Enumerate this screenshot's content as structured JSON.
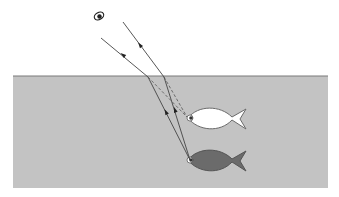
{
  "diagram": {
    "colors": {
      "background": "#ffffff",
      "water": "#c3c3c3",
      "water_surface": "#7a7a7a",
      "ray": "#444444",
      "virtual_ray": "#555555",
      "real_fish": "#6b6b6b",
      "apparent_fish": "#ffffff",
      "fish_outline": "#6a6a6a",
      "eye": "#333333"
    },
    "water": {
      "x": 13,
      "y": 76,
      "width": 315,
      "height": 112
    },
    "observer_eye": {
      "x": 99,
      "y": 16,
      "label": "observer-eye"
    },
    "real_fish": {
      "eye_x": 190,
      "eye_y": 160,
      "label": "actual fish"
    },
    "apparent_fish": {
      "eye_x": 190,
      "eye_y": 118,
      "label": "apparent image of fish"
    },
    "rays": [
      {
        "name": "ray-left",
        "air_start": [
          101,
          38
        ],
        "surface": [
          148,
          77
        ],
        "source": [
          190,
          160
        ],
        "arrow_air": [
          123,
          55
        ],
        "arrow_water": [
          166,
          112
        ]
      },
      {
        "name": "ray-right",
        "air_start": [
          123,
          22
        ],
        "surface": [
          164,
          77
        ],
        "source": [
          190,
          160
        ],
        "arrow_air": [
          140,
          45
        ],
        "arrow_water": [
          175,
          110
        ]
      }
    ]
  }
}
